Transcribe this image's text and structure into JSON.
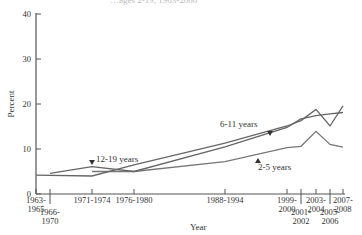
{
  "chart_data": {
    "type": "line",
    "title": "…ages 2-19, 1963-2008",
    "xlabel": "Year",
    "ylabel": "Percent",
    "ylim": [
      0,
      40
    ],
    "yticks": [
      0,
      10,
      20,
      30,
      40
    ],
    "grid": false,
    "categories": [
      "1963-1965",
      "1966-1970",
      "1971-1974",
      "1976-1980",
      "1988-1994",
      "1999-2000",
      "2001-2002",
      "2003-2004",
      "2005-2006",
      "2007-2008"
    ],
    "series": [
      {
        "name": "2-5 years",
        "values": [
          null,
          null,
          5.0,
          5.0,
          7.2,
          10.3,
          10.6,
          13.9,
          11.0,
          10.4
        ]
      },
      {
        "name": "6-11 years",
        "values": [
          4.2,
          null,
          4.0,
          6.5,
          11.3,
          15.1,
          16.3,
          18.8,
          15.1,
          19.6
        ]
      },
      {
        "name": "12-19 years",
        "values": [
          null,
          4.6,
          6.1,
          5.0,
          10.5,
          14.8,
          16.7,
          17.4,
          17.8,
          18.1
        ]
      }
    ],
    "annotations": [
      "12-19 years",
      "6-11 years",
      "2-5 years"
    ]
  }
}
